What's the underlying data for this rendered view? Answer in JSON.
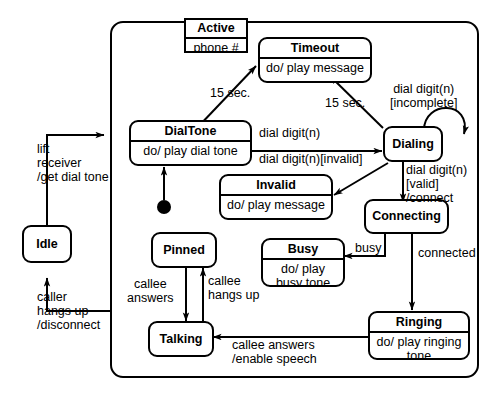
{
  "diagram": {
    "composite_state": {
      "name": "Active",
      "attribute": "phone #"
    },
    "states": [
      {
        "id": "idle",
        "name": "Idle",
        "activity": ""
      },
      {
        "id": "dialtone",
        "name": "DialTone",
        "activity": "do/ play dial tone"
      },
      {
        "id": "timeout",
        "name": "Timeout",
        "activity": "do/ play message"
      },
      {
        "id": "dialing",
        "name": "Dialing",
        "activity": ""
      },
      {
        "id": "invalid",
        "name": "Invalid",
        "activity": "do/ play message"
      },
      {
        "id": "connecting",
        "name": "Connecting",
        "activity": ""
      },
      {
        "id": "busy",
        "name": "Busy",
        "activity": "do/ play busy\ntone"
      },
      {
        "id": "ringing",
        "name": "Ringing",
        "activity": "do/ play ringing\ntone"
      },
      {
        "id": "pinned",
        "name": "Pinned",
        "activity": ""
      },
      {
        "id": "talking",
        "name": "Talking",
        "activity": ""
      }
    ],
    "initial_pseudostate": "initial-state-dot",
    "transitions": [
      {
        "id": "t1",
        "from": "idle",
        "to": "active",
        "label": "lift\nreceiver\n/get dial tone"
      },
      {
        "id": "t2",
        "from": "active",
        "to": "idle",
        "label": "caller\nhangs up\n/disconnect"
      },
      {
        "id": "t3",
        "from": "dialtone",
        "to": "timeout",
        "label": "15 sec."
      },
      {
        "id": "t4",
        "from": "dialing",
        "to": "timeout",
        "label": "15 sec."
      },
      {
        "id": "t5",
        "from": "dialtone",
        "to": "dialing",
        "label": "dial digit(n)"
      },
      {
        "id": "t6",
        "from": "dialing",
        "to": "dialing",
        "label": "dial digit(n)\n[incomplete]"
      },
      {
        "id": "t7",
        "from": "dialing",
        "to": "invalid",
        "label": "dial digit(n)[invalid]"
      },
      {
        "id": "t8",
        "from": "dialing",
        "to": "connecting",
        "label": "dial digit(n)\n[valid]\n/connect"
      },
      {
        "id": "t9",
        "from": "connecting",
        "to": "busy",
        "label": "busy"
      },
      {
        "id": "t10",
        "from": "connecting",
        "to": "ringing",
        "label": "connected"
      },
      {
        "id": "t11",
        "from": "ringing",
        "to": "talking",
        "label": "callee answers\n/enable speech"
      },
      {
        "id": "t12",
        "from": "pinned",
        "to": "talking",
        "label": "callee\nanswers"
      },
      {
        "id": "t13",
        "from": "talking",
        "to": "pinned",
        "label": "callee\nhangs up"
      }
    ],
    "labels": {
      "lift_receiver": "lift\nreceiver\n/get dial tone",
      "caller_hangs_up": "caller\nhangs up\n/disconnect",
      "timeout_from_dialtone": "15 sec.",
      "timeout_from_dialing": "15 sec.",
      "dial_digit": "dial digit(n)",
      "dial_digit_incomplete": "dial digit(n)\n[incomplete]",
      "dial_digit_invalid": "dial digit(n)[invalid]",
      "dial_digit_valid": "dial digit(n)\n[valid]\n/connect",
      "busy": "busy",
      "connected": "connected",
      "callee_answers_enable_speech": "callee answers\n/enable speech",
      "callee_answers": "callee\nanswers",
      "callee_hangs_up": "callee\nhangs up"
    },
    "colors": {
      "stroke": "#000000",
      "fill": "#ffffff",
      "background": "#ffffff"
    }
  }
}
